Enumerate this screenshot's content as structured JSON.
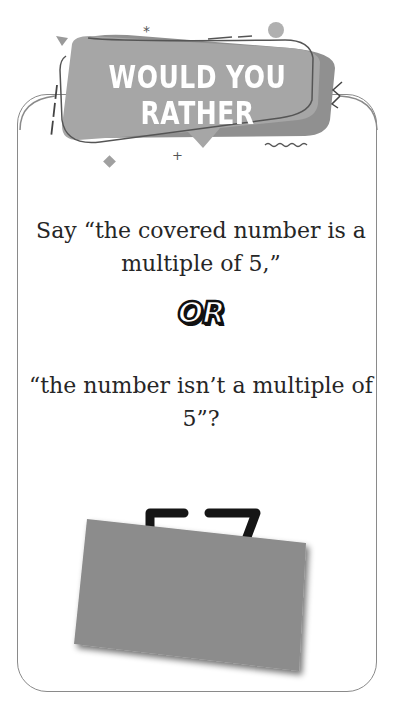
{
  "banner": {
    "title": "WOULD YOU RATHER",
    "color": "#a6a6a6"
  },
  "question": {
    "option_a": "Say “the covered number is a multiple of 5,”",
    "connector": "OR",
    "option_b": "“the number isn’t a multiple of 5”?"
  },
  "covered_number": {
    "visible_fragment": "57",
    "cover_color": "#8c8c8c",
    "state": "covered"
  },
  "card": {
    "border_color": "#8a8a8a"
  }
}
